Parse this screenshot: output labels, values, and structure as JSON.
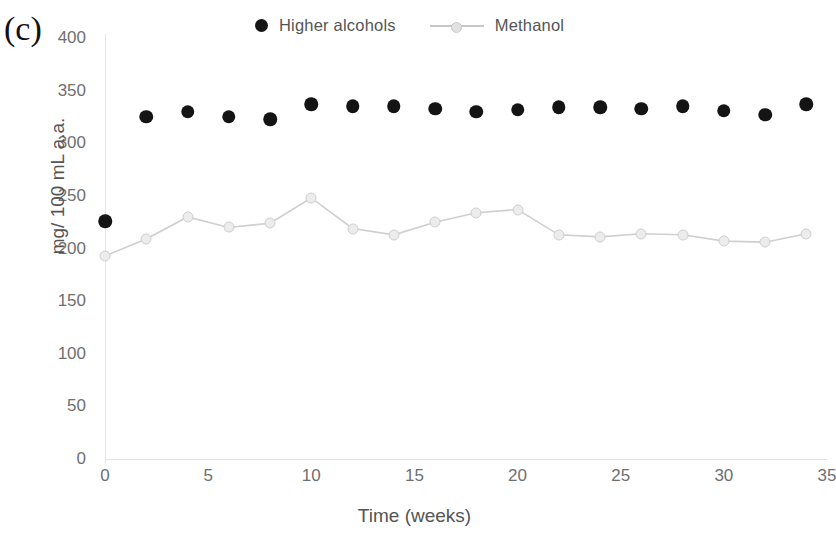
{
  "panel": {
    "label": "(c)"
  },
  "legend": {
    "entries": [
      {
        "name": "higher-alcohols",
        "label": "Higher alcohols",
        "marker": "filled-circle",
        "color": "#141414"
      },
      {
        "name": "methanol",
        "label": "Methanol",
        "marker": "line-circle",
        "color": "#c9c9c9"
      }
    ]
  },
  "chart_data": {
    "type": "scatter",
    "title": "",
    "xlabel": "Time (weeks)",
    "ylabel": "mg/ 100 mL a.a.",
    "xlim": [
      0,
      35
    ],
    "ylim": [
      0,
      400
    ],
    "xticks": [
      0,
      5,
      10,
      15,
      20,
      25,
      30,
      35
    ],
    "yticks": [
      0,
      50,
      100,
      150,
      200,
      250,
      300,
      350,
      400
    ],
    "grid": false,
    "legend_position": "top",
    "x": [
      0,
      2,
      4,
      6,
      8,
      10,
      12,
      14,
      16,
      18,
      20,
      22,
      24,
      26,
      28,
      30,
      32,
      34
    ],
    "series": [
      {
        "name": "Higher alcohols",
        "style": "markers",
        "color": "#141414",
        "values": [
          226,
          325,
          330,
          325,
          323,
          337,
          335,
          335,
          333,
          330,
          332,
          334,
          334,
          333,
          335,
          331,
          327,
          337
        ]
      },
      {
        "name": "Methanol",
        "style": "line+markers",
        "color": "#c9c9c9",
        "values": [
          193,
          209,
          230,
          220,
          224,
          248,
          219,
          213,
          225,
          234,
          237,
          213,
          211,
          214,
          213,
          207,
          206,
          214
        ]
      }
    ]
  },
  "axis": {
    "x_tick_labels": [
      "0",
      "5",
      "10",
      "15",
      "20",
      "25",
      "30",
      "35"
    ],
    "y_tick_labels": [
      "0",
      "50",
      "100",
      "150",
      "200",
      "250",
      "300",
      "350",
      "400"
    ]
  }
}
